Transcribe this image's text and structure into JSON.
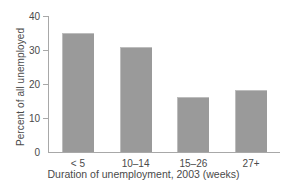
{
  "chart_data": {
    "type": "bar",
    "title": "",
    "subtitle": "",
    "xlabel": "Duration of unemployment, 2003 (weeks)",
    "ylabel": "Percent of all unemployed",
    "categories": [
      "< 5",
      "10–14",
      "15–26",
      "27+"
    ],
    "values": [
      35.0,
      31.0,
      16.2,
      18.2
    ],
    "ylim": [
      0,
      40
    ],
    "yticks": [
      0,
      10,
      20,
      30,
      40
    ],
    "ytick_labels": [
      "0",
      "10",
      "20",
      "30",
      "40"
    ],
    "grid": false,
    "legend": null,
    "series": [
      {
        "name": "Percent of all unemployed",
        "values": [
          35.0,
          31.0,
          16.2,
          18.2
        ]
      }
    ],
    "colors": {
      "bar_fill": "#9a9a9a",
      "bar_edge": "#bdbdbd",
      "axis": "#a8a8a8",
      "text": "#4a4a4a",
      "background": "#ffffff"
    }
  }
}
